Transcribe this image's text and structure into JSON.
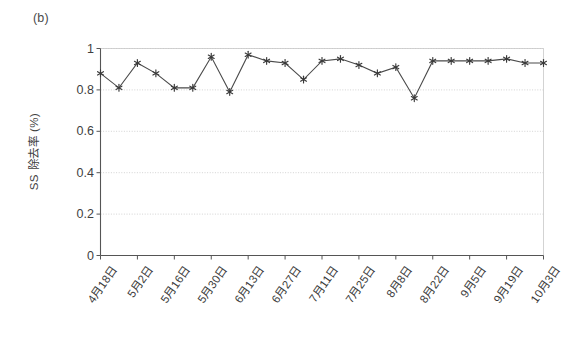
{
  "figure": {
    "panel_label": "(b)",
    "background_color": "#ffffff",
    "line_color": "#4a4a4a",
    "marker_color": "#3a3a3a",
    "axis_color": "#555555",
    "grid_color": "#c8c8c8"
  },
  "chart_data": {
    "type": "line",
    "title": "(b)",
    "xlabel": "",
    "ylabel": "SS 除去率 (%)",
    "ylim": [
      0,
      1
    ],
    "yticks": [
      0,
      0.2,
      0.4,
      0.6,
      0.8,
      1
    ],
    "ytick_labels": [
      "0",
      "0.2",
      "0.4",
      "0.6",
      "0.8",
      "1"
    ],
    "grid": true,
    "grid_axis": "y",
    "legend": false,
    "legend_position": "none",
    "marker": "asterisk",
    "xtick_labels": [
      "4月18日",
      "5月2日",
      "5月16日",
      "5月30日",
      "6月13日",
      "6月27日",
      "7月11日",
      "7月25日",
      "8月8日",
      "8月22日",
      "9月5日",
      "9月19日",
      "10月3日"
    ],
    "xtick_positions": [
      0,
      2,
      4,
      6,
      8,
      10,
      12,
      14,
      16,
      18,
      20,
      22,
      24
    ],
    "x_index_range": [
      0,
      24
    ],
    "series": [
      {
        "name": "SS 除去率",
        "x": [
          0,
          1,
          2,
          3,
          4,
          5,
          6,
          7,
          8,
          9,
          10,
          11,
          12,
          13,
          14,
          15,
          16,
          17,
          18,
          19,
          20,
          21,
          22,
          23,
          24
        ],
        "values": [
          0.88,
          0.81,
          0.93,
          0.88,
          0.81,
          0.81,
          0.96,
          0.79,
          0.97,
          0.94,
          0.93,
          0.85,
          0.94,
          0.95,
          0.92,
          0.88,
          0.91,
          0.76,
          0.94,
          0.94,
          0.94,
          0.94,
          0.95,
          0.93,
          0.93
        ]
      }
    ]
  }
}
